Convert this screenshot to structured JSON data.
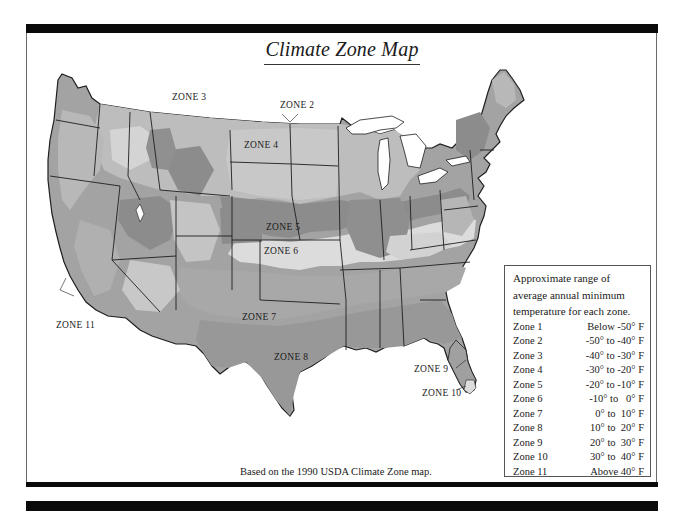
{
  "title": "Climate Zone Map",
  "caption": "Based on the 1990 USDA Climate Zone map.",
  "colors": {
    "frame": "#0a0a0a",
    "zone_lightest": "#dcdcdc",
    "zone_light": "#bdbdbd",
    "zone_mid": "#a3a3a3",
    "zone_dark": "#8c8c8c",
    "outline": "#1e1e1e",
    "water": "#ffffff"
  },
  "map_labels": [
    {
      "id": "zone2",
      "text": "ZONE 2"
    },
    {
      "id": "zone3",
      "text": "ZONE 3"
    },
    {
      "id": "zone4",
      "text": "ZONE 4"
    },
    {
      "id": "zone5",
      "text": "ZONE 5"
    },
    {
      "id": "zone6",
      "text": "ZONE 6"
    },
    {
      "id": "zone7",
      "text": "ZONE 7"
    },
    {
      "id": "zone8",
      "text": "ZONE 8"
    },
    {
      "id": "zone9",
      "text": "ZONE 9"
    },
    {
      "id": "zone10",
      "text": "ZONE 10"
    },
    {
      "id": "zone11",
      "text": "ZONE 11"
    }
  ],
  "legend": {
    "intro": [
      "Approximate range of",
      "average annual minimum",
      "temperature for each zone."
    ],
    "rows": [
      {
        "zone": "Zone 1",
        "range": "Below -50° F"
      },
      {
        "zone": "Zone 2",
        "range": "-50° to -40° F"
      },
      {
        "zone": "Zone 3",
        "range": "-40° to -30° F"
      },
      {
        "zone": "Zone 4",
        "range": "-30° to -20° F"
      },
      {
        "zone": "Zone 5",
        "range": "-20° to -10° F"
      },
      {
        "zone": "Zone 6",
        "range": "-10° to   0° F"
      },
      {
        "zone": "Zone 7",
        "range": "0° to  10° F"
      },
      {
        "zone": "Zone 8",
        "range": "10° to  20° F"
      },
      {
        "zone": "Zone 9",
        "range": "20° to  30° F"
      },
      {
        "zone": "Zone 10",
        "range": "30° to  40° F"
      },
      {
        "zone": "Zone 11",
        "range": "Above 40° F"
      }
    ]
  }
}
